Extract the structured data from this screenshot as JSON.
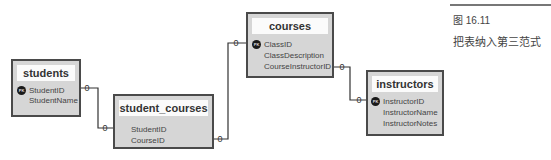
{
  "figure": {
    "number": "图 16.11",
    "caption": "把表纳入第三范式"
  },
  "tables": {
    "students": {
      "title": "students",
      "fields": [
        "StudentID",
        "StudentName"
      ],
      "pk_label": "PK"
    },
    "student_courses": {
      "title": "student_courses",
      "fields": [
        "StudentID",
        "CourseID"
      ]
    },
    "courses": {
      "title": "courses",
      "fields": [
        "ClassID",
        "ClassDescription",
        "CourseInstructorID"
      ],
      "pk_label": "PK"
    },
    "instructors": {
      "title": "instructors",
      "fields": [
        "InstructorID",
        "InstructorName",
        "InstructorNotes"
      ],
      "pk_label": "PK"
    }
  },
  "relationships": [
    {
      "from": "students.StudentID",
      "to": "student_courses.StudentID",
      "from_card": "0",
      "to_card": "0"
    },
    {
      "from": "student_courses.CourseID",
      "to": "courses.ClassID",
      "from_card": "0",
      "to_card": "0"
    },
    {
      "from": "courses.CourseInstructorID",
      "to": "instructors.InstructorID",
      "from_card": "0",
      "to_card": "0"
    }
  ],
  "colors": {
    "box_fill": "#d6d6d6",
    "box_border": "#4a4a4a",
    "title_fill": "#fbfbfb",
    "line": "#333333"
  }
}
